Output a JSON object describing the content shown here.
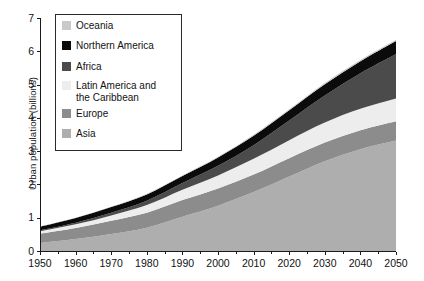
{
  "chart_data": {
    "type": "area",
    "title": "",
    "xlabel": "",
    "ylabel": "Urban population (billions)",
    "xlim": [
      1950,
      2050
    ],
    "ylim": [
      0,
      7
    ],
    "grid": false,
    "legend_position": "top-left inside plot",
    "stacked": true,
    "x": [
      1950,
      1960,
      1970,
      1980,
      1990,
      2000,
      2010,
      2020,
      2030,
      2040,
      2050
    ],
    "xticks": [
      "1950",
      "1960",
      "1970",
      "1980",
      "1990",
      "2000",
      "2010",
      "2020",
      "2030",
      "2040",
      "2050"
    ],
    "yticks": [
      "0",
      "1",
      "2",
      "3",
      "4",
      "5",
      "6",
      "7"
    ],
    "series": [
      {
        "name": "Asia",
        "color": "#aeaeae",
        "values": [
          0.24,
          0.36,
          0.51,
          0.7,
          1.03,
          1.36,
          1.77,
          2.24,
          2.7,
          3.06,
          3.32
        ]
      },
      {
        "name": "Europe",
        "color": "#8c8c8c",
        "values": [
          0.28,
          0.33,
          0.4,
          0.45,
          0.5,
          0.52,
          0.53,
          0.55,
          0.56,
          0.57,
          0.58
        ]
      },
      {
        "name": "Latin America and\nthe Caribbean",
        "color": "#ededed",
        "values": [
          0.07,
          0.11,
          0.16,
          0.23,
          0.31,
          0.39,
          0.47,
          0.54,
          0.6,
          0.64,
          0.68
        ]
      },
      {
        "name": "Africa",
        "color": "#4b4b4b",
        "values": [
          0.03,
          0.05,
          0.08,
          0.13,
          0.2,
          0.29,
          0.41,
          0.59,
          0.81,
          1.07,
          1.34
        ]
      },
      {
        "name": "Northern America",
        "color": "#0b0b0b",
        "values": [
          0.11,
          0.14,
          0.17,
          0.19,
          0.21,
          0.25,
          0.28,
          0.31,
          0.34,
          0.36,
          0.39
        ]
      },
      {
        "name": "Oceania",
        "color": "#c9c9c9",
        "values": [
          0.01,
          0.01,
          0.01,
          0.02,
          0.02,
          0.02,
          0.03,
          0.03,
          0.04,
          0.04,
          0.04
        ]
      }
    ],
    "totals": [
      0.74,
      1.0,
      1.33,
      1.72,
      2.27,
      2.83,
      3.49,
      4.26,
      5.05,
      5.74,
      6.35
    ]
  },
  "legend": {
    "items": [
      {
        "label": "Oceania",
        "color": "#c9c9c9"
      },
      {
        "label": "Northern America",
        "color": "#0b0b0b"
      },
      {
        "label": "Africa",
        "color": "#4b4b4b"
      },
      {
        "label": "Latin America and\nthe Caribbean",
        "color": "#ededed"
      },
      {
        "label": "Europe",
        "color": "#8c8c8c"
      },
      {
        "label": "Asia",
        "color": "#aeaeae"
      }
    ]
  },
  "axes": {
    "y_title": "Urban population (billions)",
    "y_ticks": [
      "7",
      "6",
      "5",
      "4",
      "3",
      "2",
      "1",
      "0"
    ],
    "x_ticks": [
      "1950",
      "1960",
      "1970",
      "1980",
      "1990",
      "2000",
      "2010",
      "2020",
      "2030",
      "2040",
      "2050"
    ]
  },
  "colors": {
    "axis": "#1a1a1a",
    "background": "#ffffff",
    "legend_border": "#2a2a2a"
  }
}
